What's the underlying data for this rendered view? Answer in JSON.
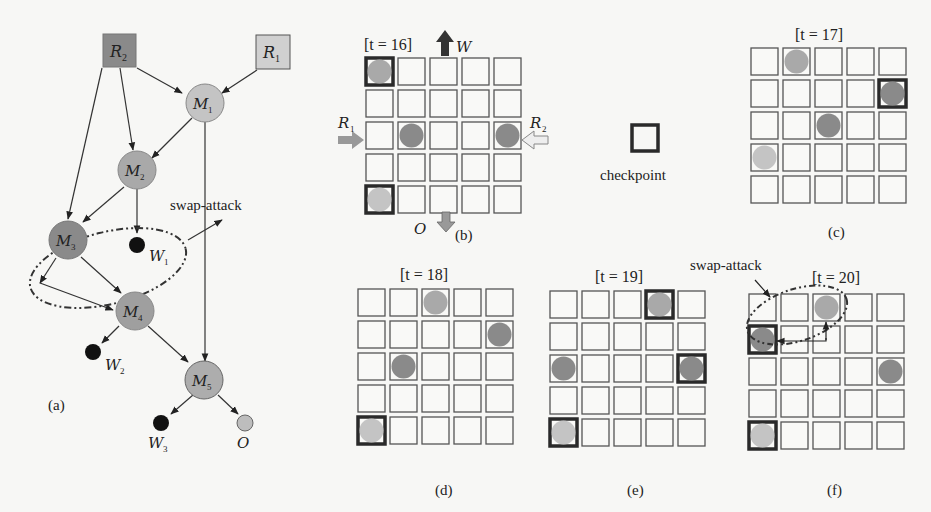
{
  "colors": {
    "background": "#f7f7f5",
    "dark_node": "#8a8a8a",
    "mid_node": "#a6a6a6",
    "light_node": "#c8c8c8",
    "checkpoint_border": "#2a2a2a",
    "cell_border": "#555555",
    "waste": "#111111"
  },
  "graph": {
    "label": "(a)",
    "nodes": [
      {
        "id": "R2",
        "base": "R",
        "sub": "2",
        "kind": "reservoir",
        "shade": "dark"
      },
      {
        "id": "R1",
        "base": "R",
        "sub": "1",
        "kind": "reservoir",
        "shade": "light"
      },
      {
        "id": "M1",
        "base": "M",
        "sub": "1",
        "kind": "mixer",
        "shade": "light"
      },
      {
        "id": "M2",
        "base": "M",
        "sub": "2",
        "kind": "mixer",
        "shade": "mid"
      },
      {
        "id": "M3",
        "base": "M",
        "sub": "3",
        "kind": "mixer",
        "shade": "dark"
      },
      {
        "id": "M4",
        "base": "M",
        "sub": "4",
        "kind": "mixer",
        "shade": "mid"
      },
      {
        "id": "M5",
        "base": "M",
        "sub": "5",
        "kind": "mixer",
        "shade": "mid"
      },
      {
        "id": "W1",
        "base": "W",
        "sub": "1",
        "kind": "waste"
      },
      {
        "id": "W2",
        "base": "W",
        "sub": "2",
        "kind": "waste"
      },
      {
        "id": "W3",
        "base": "W",
        "sub": "3",
        "kind": "waste"
      },
      {
        "id": "O",
        "base": "O",
        "sub": "",
        "kind": "output"
      }
    ],
    "edges": [
      [
        "R2",
        "M1"
      ],
      [
        "R1",
        "M1"
      ],
      [
        "R2",
        "M2"
      ],
      [
        "M1",
        "M2"
      ],
      [
        "R2",
        "M3"
      ],
      [
        "M2",
        "M3"
      ],
      [
        "M2",
        "W1"
      ],
      [
        "M3",
        "M4"
      ],
      [
        "M3",
        "M4b"
      ],
      [
        "M4",
        "W2"
      ],
      [
        "M4",
        "M5"
      ],
      [
        "M1",
        "M5"
      ],
      [
        "M5",
        "W3"
      ],
      [
        "M5",
        "O"
      ]
    ],
    "annotation": "swap-attack"
  },
  "legend": {
    "checkpoint_label": "checkpoint"
  },
  "panels": [
    {
      "id": "b",
      "caption": "(b)",
      "time_label": "[t = 16]",
      "ports": {
        "W": "W",
        "O": "O",
        "R1": "R",
        "R1_sub": "1",
        "R2": "R",
        "R2_sub": "2"
      },
      "checkpoints": [
        [
          0,
          0
        ],
        [
          4,
          0
        ]
      ],
      "droplets": [
        {
          "row": 0,
          "col": 0,
          "shade": "mid"
        },
        {
          "row": 2,
          "col": 1,
          "shade": "dark"
        },
        {
          "row": 2,
          "col": 4,
          "shade": "dark"
        },
        {
          "row": 4,
          "col": 0,
          "shade": "light"
        }
      ]
    },
    {
      "id": "c",
      "caption": "(c)",
      "time_label": "[t = 17]",
      "checkpoints": [
        [
          1,
          4
        ]
      ],
      "droplets": [
        {
          "row": 0,
          "col": 1,
          "shade": "mid"
        },
        {
          "row": 1,
          "col": 4,
          "shade": "dark"
        },
        {
          "row": 2,
          "col": 2,
          "shade": "dark"
        },
        {
          "row": 3,
          "col": 0,
          "shade": "light"
        }
      ]
    },
    {
      "id": "d",
      "caption": "(d)",
      "time_label": "[t = 18]",
      "checkpoints": [
        [
          4,
          0
        ]
      ],
      "droplets": [
        {
          "row": 0,
          "col": 2,
          "shade": "mid"
        },
        {
          "row": 1,
          "col": 4,
          "shade": "dark"
        },
        {
          "row": 2,
          "col": 1,
          "shade": "dark"
        },
        {
          "row": 4,
          "col": 0,
          "shade": "light"
        }
      ]
    },
    {
      "id": "e",
      "caption": "(e)",
      "time_label": "[t = 19]",
      "checkpoints": [
        [
          0,
          3
        ],
        [
          2,
          4
        ],
        [
          4,
          0
        ]
      ],
      "droplets": [
        {
          "row": 0,
          "col": 3,
          "shade": "mid"
        },
        {
          "row": 2,
          "col": 0,
          "shade": "dark"
        },
        {
          "row": 2,
          "col": 4,
          "shade": "dark"
        },
        {
          "row": 4,
          "col": 0,
          "shade": "light"
        }
      ]
    },
    {
      "id": "f",
      "caption": "(f)",
      "time_label": "[t = 20]",
      "annotation": "swap-attack",
      "checkpoints": [
        [
          1,
          0
        ],
        [
          4,
          0
        ]
      ],
      "droplets": [
        {
          "row": 0,
          "col": 2,
          "shade": "mid"
        },
        {
          "row": 1,
          "col": 0,
          "shade": "dark"
        },
        {
          "row": 2,
          "col": 4,
          "shade": "dark"
        },
        {
          "row": 4,
          "col": 0,
          "shade": "light"
        }
      ]
    }
  ]
}
